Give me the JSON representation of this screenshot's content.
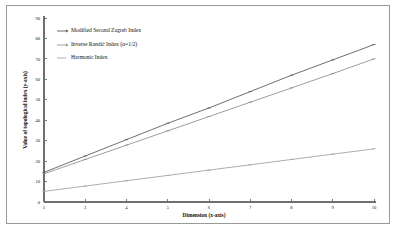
{
  "chart_data": {
    "type": "line",
    "title": "",
    "xlabel": "Dimension (x-axis)",
    "ylabel": "Value of topological index (y-axis)",
    "x": [
      2,
      3,
      4,
      5,
      6,
      7,
      8,
      9,
      10
    ],
    "xlim": [
      2,
      10
    ],
    "ylim": [
      0,
      90
    ],
    "xticks": [
      "2",
      "3",
      "4",
      "5",
      "6",
      "7",
      "8",
      "9",
      "10"
    ],
    "yticks": [
      "0",
      "10",
      "20",
      "30",
      "40",
      "50",
      "60",
      "70",
      "80",
      "90"
    ],
    "grid": false,
    "legend_position": "upper-left",
    "series": [
      {
        "name": "Modified Second Zagreb Index",
        "color": "#555555",
        "marker": "dash-arrow",
        "values": [
          14.5,
          22.5,
          30.5,
          38.5,
          46.0,
          54.0,
          62.0,
          69.5,
          77.0
        ]
      },
      {
        "name": "Inverse Randić Index (α=1/2)",
        "color": "#8c8c8c",
        "marker": "dash-arrow",
        "values": [
          13.8,
          20.8,
          27.8,
          34.8,
          41.8,
          48.8,
          55.8,
          62.8,
          70.0
        ]
      },
      {
        "name": "Harmonic Index",
        "color": "#9e9e9e",
        "marker": "dash",
        "values": [
          5.2,
          7.8,
          10.4,
          13.0,
          15.6,
          18.2,
          20.8,
          23.4,
          26.0
        ]
      }
    ]
  },
  "legend": {
    "items": [
      {
        "label": "Modified Second Zagreb Index"
      },
      {
        "label": "Inverse Randić Index (α=1/2)"
      },
      {
        "label": "Harmonic Index"
      }
    ]
  }
}
